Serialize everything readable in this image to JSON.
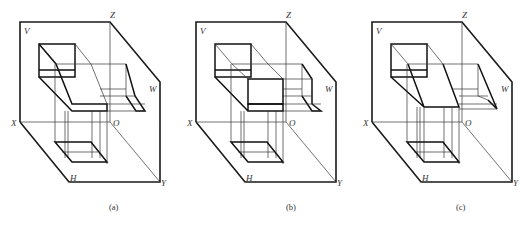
{
  "figure": {
    "panels": [
      {
        "id": "a",
        "caption": "(a)",
        "offset_x": 0,
        "labels": {
          "V": "V",
          "Z": "Z",
          "W": "W",
          "X": "X",
          "O": "O",
          "H": "H",
          "Y": "Y"
        }
      },
      {
        "id": "b",
        "caption": "(b)",
        "offset_x": 176,
        "labels": {
          "V": "V",
          "Z": "Z",
          "W": "W",
          "X": "X",
          "O": "O",
          "H": "H",
          "Y": "Y"
        }
      },
      {
        "id": "c",
        "caption": "(c)",
        "offset_x": 177,
        "labels": {
          "V": "V",
          "Z": "Z",
          "W": "W",
          "X": "X",
          "O": "O",
          "H": "H",
          "Y": "Y"
        }
      }
    ],
    "projection_planes": [
      "V",
      "H",
      "W"
    ],
    "axes": [
      "X",
      "Y",
      "Z",
      "O"
    ]
  }
}
